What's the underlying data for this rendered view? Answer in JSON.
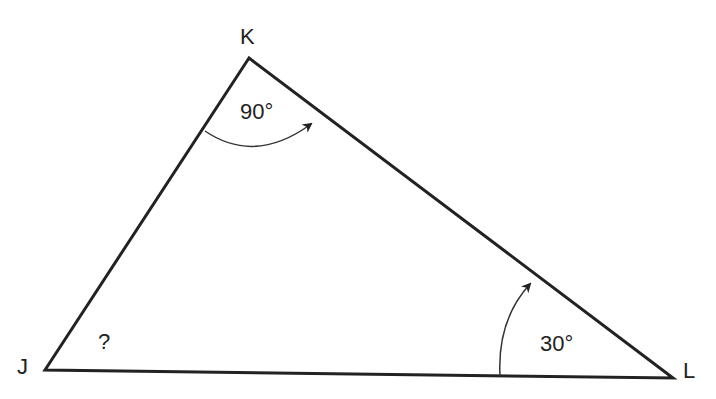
{
  "diagram": {
    "type": "triangle",
    "vertices": [
      {
        "name": "K",
        "x": 249,
        "y": 58
      },
      {
        "name": "J",
        "x": 45,
        "y": 370
      },
      {
        "name": "L",
        "x": 673,
        "y": 378
      }
    ],
    "vertex_labels": {
      "K": "K",
      "J": "J",
      "L": "L"
    },
    "angles": {
      "K": "90°",
      "L": "30°",
      "J": "?"
    },
    "colors": {
      "stroke": "#222222",
      "arc": "#333333",
      "background": "#ffffff"
    }
  }
}
